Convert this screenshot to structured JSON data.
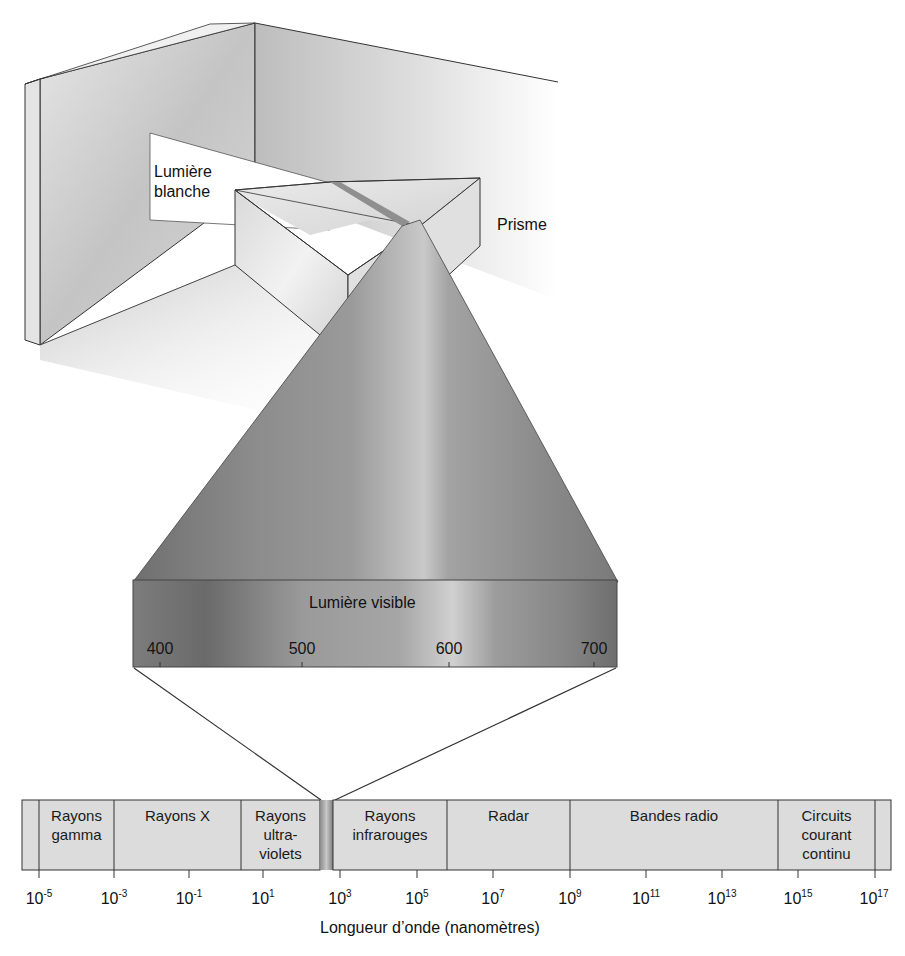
{
  "diagram": {
    "labels": {
      "white_light": [
        "Lumière",
        "blanche"
      ],
      "prism": "Prisme",
      "visible_light": "Lumière visible"
    },
    "visible_scale": {
      "ticks": [
        {
          "label": "400",
          "x": 160
        },
        {
          "label": "500",
          "x": 302
        },
        {
          "label": "600",
          "x": 449
        },
        {
          "label": "700",
          "x": 594
        }
      ]
    },
    "spectrum": {
      "bands": [
        {
          "label": "",
          "x0": 22,
          "x1": 39
        },
        {
          "label": "Rayons\ngamma",
          "x0": 39,
          "x1": 114
        },
        {
          "label": "Rayons X",
          "x0": 114,
          "x1": 241
        },
        {
          "label": "Rayons\nultra-\nviolets",
          "x0": 241,
          "x1": 320
        },
        {
          "label": "Rayons\ninfrarouges",
          "x0": 333,
          "x1": 447
        },
        {
          "label": "Radar",
          "x0": 447,
          "x1": 570
        },
        {
          "label": "Bandes radio",
          "x0": 570,
          "x1": 778
        },
        {
          "label": "Circuits\ncourant\ncontinu",
          "x0": 778,
          "x1": 875
        },
        {
          "label": "",
          "x0": 875,
          "x1": 891
        }
      ],
      "axis_ticks": [
        {
          "base": "10",
          "exp": "-5",
          "x": 39
        },
        {
          "base": "10",
          "exp": "-3",
          "x": 114
        },
        {
          "base": "10",
          "exp": "-1",
          "x": 189
        },
        {
          "base": "10",
          "exp": "1",
          "x": 263
        },
        {
          "base": "10",
          "exp": "3",
          "x": 340
        },
        {
          "base": "10",
          "exp": "5",
          "x": 417
        },
        {
          "base": "10",
          "exp": "7",
          "x": 493
        },
        {
          "base": "10",
          "exp": "9",
          "x": 570
        },
        {
          "base": "10",
          "exp": "11",
          "x": 646
        },
        {
          "base": "10",
          "exp": "13",
          "x": 722
        },
        {
          "base": "10",
          "exp": "15",
          "x": 798
        },
        {
          "base": "10",
          "exp": "17",
          "x": 874
        }
      ],
      "axis_label": "Longueur d’onde (nanomètres)"
    },
    "colors": {
      "band_fill": "#dcdcdc",
      "outline": "#2a2a2a",
      "wall": "#c9c9c9",
      "cone_dark": "#7a7a7a",
      "cone_light": "#b5b5b5"
    }
  }
}
